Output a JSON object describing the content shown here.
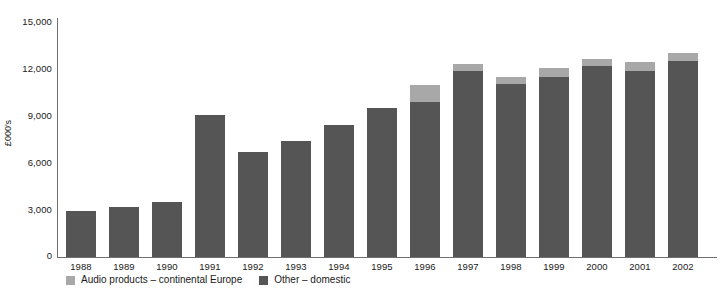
{
  "chart_data": {
    "type": "bar",
    "subtype": "stacked-vertical",
    "title": "",
    "subtitle": "",
    "xlabel": "",
    "ylabel": "£000's",
    "categories": [
      "1988",
      "1989",
      "1990",
      "1991",
      "1992",
      "1993",
      "1994",
      "1995",
      "1996",
      "1997",
      "1998",
      "1999",
      "2000",
      "2001",
      "2002"
    ],
    "series": [
      {
        "name": "Other – domestic",
        "color": "#555555",
        "values": [
          2950,
          3200,
          3500,
          9050,
          6700,
          7400,
          8450,
          9500,
          9900,
          11900,
          11050,
          11500,
          12200,
          11900,
          12500
        ]
      },
      {
        "name": "Audio products – continental Europe",
        "color": "#a8a8a8",
        "values": [
          0,
          0,
          0,
          0,
          0,
          0,
          0,
          0,
          1050,
          400,
          450,
          550,
          450,
          550,
          500
        ]
      }
    ],
    "totals": [
      2950,
      3200,
      3500,
      9050,
      6700,
      7400,
      8450,
      9500,
      10950,
      12300,
      11500,
      12050,
      12650,
      12450,
      13000
    ],
    "ylim": [
      0,
      15000
    ],
    "yticks": [
      0,
      3000,
      6000,
      9000,
      12000,
      15000
    ],
    "ytick_labels": [
      "0",
      "3,000",
      "6,000",
      "9,000",
      "12,000",
      "15,000"
    ],
    "grid": false,
    "legend_position": "bottom-left",
    "axis_color": "#6f6f6f",
    "background": "#ffffff"
  },
  "legend": {
    "items": [
      {
        "label": "Audio products – continental Europe",
        "color": "#a8a8a8"
      },
      {
        "label": "Other – domestic",
        "color": "#555555"
      }
    ]
  }
}
